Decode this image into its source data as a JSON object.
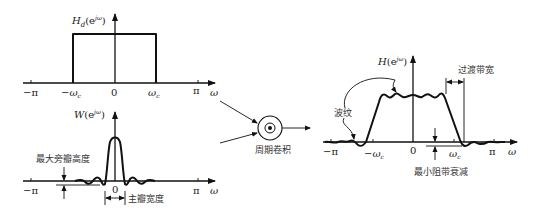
{
  "figure": {
    "panel_ideal": {
      "y_label": "H_d(e^{jω})",
      "y_label_main": "H",
      "y_label_sub": "d",
      "y_label_arg": "(e",
      "y_label_exp": "jω",
      "y_label_close": ")",
      "x_label": "ω",
      "ticks": [
        "−π",
        "−ω",
        "0",
        "ω",
        "π"
      ],
      "tick_sub": "c"
    },
    "panel_window": {
      "y_label_main": "W",
      "y_label_arg": "(e",
      "y_label_exp": "jω",
      "y_label_close": ")",
      "x_label": "ω",
      "ticks": [
        "−π",
        "0",
        "π"
      ],
      "annotation_sidelobe": "最大旁瓣高度",
      "annotation_mainlobe": "主瓣宽度"
    },
    "convolution": {
      "symbol": "⊙",
      "label": "周期卷积"
    },
    "panel_result": {
      "y_label_main": "H",
      "y_label_arg": "(e",
      "y_label_exp": "jω",
      "y_label_close": ")",
      "x_label": "ω",
      "ticks": [
        "−π",
        "−ω",
        "0",
        "ω",
        "π"
      ],
      "tick_sub": "c",
      "annotation_ripple": "波纹",
      "annotation_transition": "过渡带宽",
      "annotation_stopband": "最小阻带衰减"
    },
    "colors": {
      "line": "#111111",
      "text": "#1a1a1a",
      "background": "#ffffff"
    }
  }
}
